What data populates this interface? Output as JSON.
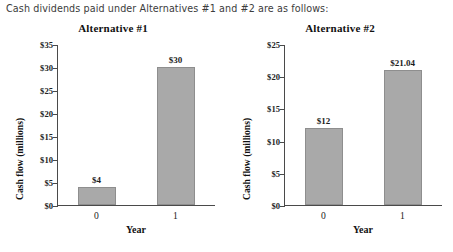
{
  "caption": "Cash dividends paid under Alternatives #1 and #2 are as follows:",
  "chart_data": [
    {
      "type": "bar",
      "title": "Alternative #1",
      "categories": [
        "0",
        "1"
      ],
      "values": [
        4,
        30
      ],
      "value_labels": [
        "$4",
        "$30"
      ],
      "xlabel": "Year",
      "ylabel": "Cash flow (millions)",
      "ylim": [
        0,
        35
      ],
      "ytick_step": 5,
      "yticks": [
        0,
        5,
        10,
        15,
        20,
        25,
        30,
        35
      ],
      "ytick_labels": [
        "$0",
        "$5",
        "$10",
        "$15",
        "$20",
        "$25",
        "$30",
        "$35"
      ],
      "grid": false,
      "legend": false,
      "bar_color": "#a9a9a9"
    },
    {
      "type": "bar",
      "title": "Alternative #2",
      "categories": [
        "0",
        "1"
      ],
      "values": [
        12,
        21.04
      ],
      "value_labels": [
        "$12",
        "$21.04"
      ],
      "xlabel": "Year",
      "ylabel": "Cash flow (millions)",
      "ylim": [
        0,
        25
      ],
      "ytick_step": 5,
      "yticks": [
        0,
        5,
        10,
        15,
        20,
        25
      ],
      "ytick_labels": [
        "$0",
        "$5",
        "$10",
        "$15",
        "$20",
        "$25"
      ],
      "grid": false,
      "legend": false,
      "bar_color": "#a9a9a9"
    }
  ]
}
